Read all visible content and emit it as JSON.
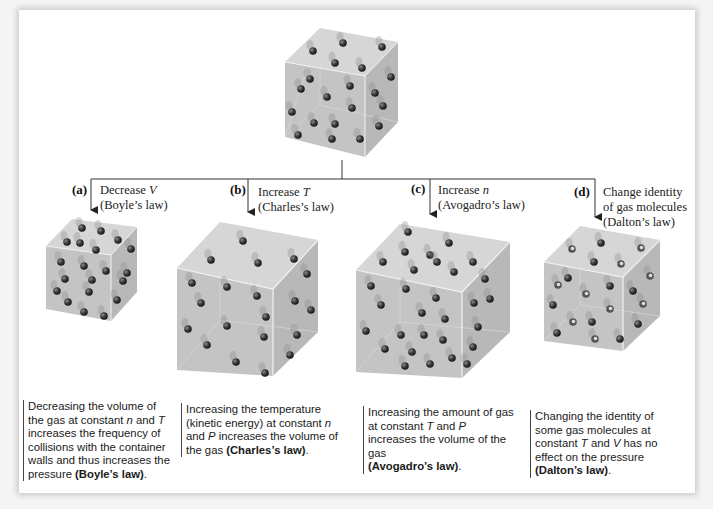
{
  "figure": {
    "top_cube": {
      "description": "container of gas molecules (initial state)"
    },
    "branches": [
      {
        "id": "a",
        "tag": "(a)",
        "change_prefix": "Decrease ",
        "change_var": "V",
        "change_suffix": "",
        "law_label": "(Boyle’s law)",
        "caption_parts": [
          "Decreasing the volume of the gas at constant ",
          "n",
          " and ",
          "T",
          " increases the frequency of collisions with the container walls and thus increases the pressure ",
          "(Boyle’s law)",
          "."
        ]
      },
      {
        "id": "b",
        "tag": "(b)",
        "change_prefix": "Increase ",
        "change_var": "T",
        "change_suffix": "",
        "law_label": "(Charles’s law)",
        "caption_parts": [
          "Increasing the temperature (kinetic energy) at constant ",
          "n",
          " and ",
          "P",
          " increases the volume of the gas ",
          "(Charles’s law)",
          "."
        ]
      },
      {
        "id": "c",
        "tag": "(c)",
        "change_prefix": "Increase ",
        "change_var": "n",
        "change_suffix": "",
        "law_label": "(Avogadro’s law)",
        "caption_parts": [
          "Increasing the amount of gas at constant ",
          "T",
          " and ",
          "P",
          " increases the volume of the gas ",
          "(Avogadro’s law)",
          "."
        ]
      },
      {
        "id": "d",
        "tag": "(d)",
        "change_prefix": "Change identity of gas molecules",
        "change_var": "",
        "change_suffix": "",
        "law_label": "(Dalton’s law)",
        "caption_parts": [
          "Changing the identity of some gas molecules at constant ",
          "T",
          " and ",
          "V",
          " has no effect on the pressure ",
          "(Dalton’s law)",
          "."
        ]
      }
    ],
    "colors": {
      "cube_face": "#c9c9c9",
      "cube_edge": "#eeeeee",
      "molecule": "#3a3a3a",
      "line": "#333333",
      "card": "#ffffff",
      "background": "#f4f4f4"
    }
  }
}
